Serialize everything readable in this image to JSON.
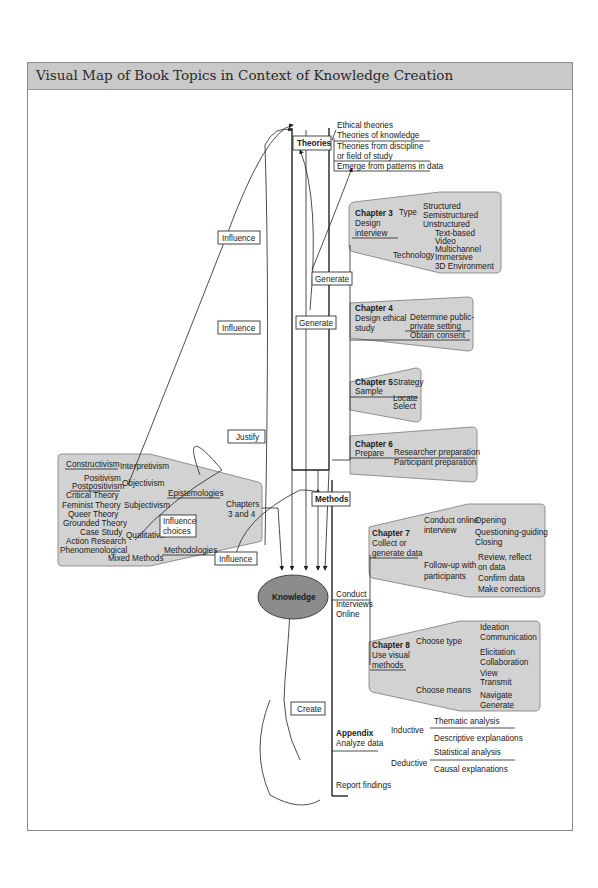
{
  "title": "Visual Map of Book Topics in Context of Knowledge Creation",
  "center": {
    "label": "Knowledge",
    "color": "#8c8c8c"
  },
  "theories": {
    "label": "Theories",
    "items": [
      "Ethical theories",
      "Theories of knowledge",
      "Theories from discipline",
      "or field of study",
      "Emerge from patterns in data"
    ]
  },
  "methods": {
    "label": "Methods"
  },
  "connectors": {
    "influence1": "Influence",
    "influence2": "Influence",
    "influence3": "Influence",
    "generate1": "Generate",
    "generate2": "Generate",
    "justify": "Justify",
    "influence_choices_1": "Influence",
    "influence_choices_2": "choices",
    "create": "Create"
  },
  "chapters34": {
    "label_1": "Chapters",
    "label_2": "3 and 4",
    "epistemologies": "Epistemologies",
    "methodologies": "Methodologies",
    "interpretivism": "Interpretivism",
    "constructivism": "Constructivism",
    "objectivism": "Objectivism",
    "positivism": "Positivism",
    "postpositivism": "Postpositivism",
    "subjectivism": "Subjectivism",
    "critical_theory": "Critical Theory",
    "feminist_theory": "Feminist Theory",
    "queer_theory": "Queer Theory",
    "qualitative": "Qualitative",
    "grounded_theory": "Grounded Theory",
    "case_study": "Case Study",
    "action_research": "Action Research",
    "phenomenological": "Phenomenological",
    "mixed_methods": "Mixed Methods"
  },
  "chapter3": {
    "heading": "Chapter 3",
    "line1": "Design",
    "line2": "interview",
    "type": "Type",
    "type_items": [
      "Structured",
      "Semistructured",
      "Unstructured"
    ],
    "technology": "Technology",
    "tech_items": [
      "Text-based",
      "Video",
      "Multichannel",
      "Immersive",
      "3D Environment"
    ]
  },
  "chapter4": {
    "heading": "Chapter 4",
    "line1": "Design ethical",
    "line2": "study",
    "item1a": "Determine public-",
    "item1b": "private setting",
    "item2": "Obtain consent"
  },
  "chapter5": {
    "heading": "Chapter 5",
    "line1": "Sample",
    "items": [
      "Strategy",
      "Locate",
      "Select"
    ]
  },
  "chapter6": {
    "heading": "Chapter 6",
    "line1": "Prepare",
    "items": [
      "Researcher preparation",
      "Participant preparation"
    ]
  },
  "conduct": {
    "line1": "Conduct",
    "line2": "Interviews",
    "line3": "Online"
  },
  "chapter7": {
    "heading": "Chapter 7",
    "line1": "Collect or",
    "line2": "generate data",
    "branch1a": "Conduct online",
    "branch1b": "interview",
    "branch1_items": [
      "Opening",
      "Questioning-guiding",
      "Closing"
    ],
    "branch2a": "Follow-up with",
    "branch2b": "participants",
    "branch2_items": [
      "Review, reflect",
      "on data",
      "Confirm data",
      "Make corrections"
    ]
  },
  "chapter8": {
    "heading": "Chapter 8",
    "line1": "Use visual",
    "line2": "methods",
    "branch1": "Choose type",
    "branch1_items": [
      "Ideation",
      "Communication",
      "Elicitation",
      "Collaboration"
    ],
    "branch2": "Choose means",
    "branch2_items": [
      "View",
      "Transmit",
      "Navigate",
      "Generate"
    ]
  },
  "appendix": {
    "heading": "Appendix",
    "line1": "Analyze data",
    "inductive": "Inductive",
    "inductive_items": [
      "Thematic analysis",
      "Descriptive explanations"
    ],
    "deductive": "Deductive",
    "deductive_items": [
      "Statistical analysis",
      "Causal explanations"
    ],
    "report": "Report findings"
  }
}
